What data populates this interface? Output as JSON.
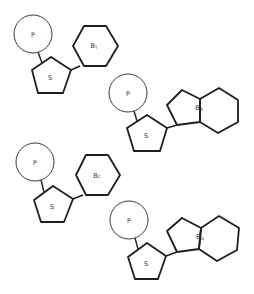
{
  "diagram": {
    "type": "nucleotides",
    "units": [
      {
        "id": "thymine-nucleotide",
        "phosphate_label": "P",
        "sugar_label": "S",
        "base_label": "B",
        "base_subscript": "T",
        "base_shape": "hexagon"
      },
      {
        "id": "adenine-nucleotide",
        "phosphate_label": "P",
        "sugar_label": "S",
        "base_label": "B",
        "base_subscript": "A",
        "base_shape": "purine"
      },
      {
        "id": "cytosine-nucleotide",
        "phosphate_label": "P",
        "sugar_label": "S",
        "base_label": "B",
        "base_subscript": "C",
        "base_shape": "hexagon"
      },
      {
        "id": "guanine-nucleotide",
        "phosphate_label": "P",
        "sugar_label": "S",
        "base_label": "B",
        "base_subscript": "G",
        "base_shape": "purine"
      }
    ],
    "colors": {
      "stroke": "#1e1e1e",
      "background": "#ffffff"
    }
  }
}
